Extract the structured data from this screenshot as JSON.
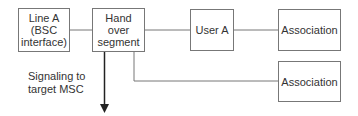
{
  "nodes": {
    "line_a": {
      "label": "Line A (BSC interface)",
      "l1": "Line A",
      "l2": "(BSC",
      "l3": "interface)"
    },
    "handover": {
      "l1": "Hand",
      "l2": "over",
      "l3": "segment"
    },
    "user_a": {
      "label": "User A"
    },
    "assoc1": {
      "label": "Association"
    },
    "assoc2": {
      "label": "Association"
    }
  },
  "annotation": {
    "l1": "Signaling to",
    "l2": "target MSC"
  },
  "colors": {
    "stroke": "#777777",
    "arrow": "#222222",
    "text": "#333333"
  }
}
